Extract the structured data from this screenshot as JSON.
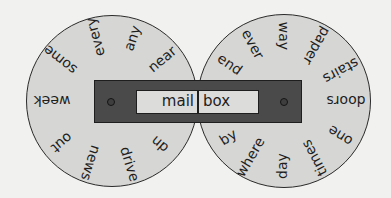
{
  "colors": {
    "background": "#f1f1ef",
    "wheel_fill": "#d6d6d4",
    "slider_fill": "#4a4a4a",
    "outline": "#1e1e1e"
  },
  "window": {
    "left_word": "mail",
    "right_word": "box"
  },
  "left_wheel": {
    "center": [
      112,
      101
    ],
    "radius": 86,
    "words": [
      {
        "text": "near",
        "x": 162,
        "y": 59,
        "rot": -40
      },
      {
        "text": "any",
        "x": 132,
        "y": 38,
        "rot": -72
      },
      {
        "text": "every",
        "x": 95,
        "y": 37,
        "rot": -105
      },
      {
        "text": "some",
        "x": 60,
        "y": 60,
        "rot": -142
      },
      {
        "text": "week",
        "x": 52,
        "y": 101,
        "rot": 180
      },
      {
        "text": "out",
        "x": 62,
        "y": 143,
        "rot": 140
      },
      {
        "text": "news",
        "x": 91,
        "y": 163,
        "rot": 108
      },
      {
        "text": "drive",
        "x": 130,
        "y": 164,
        "rot": 73
      },
      {
        "text": "up",
        "x": 161,
        "y": 143,
        "rot": 40
      }
    ]
  },
  "right_wheel": {
    "center": [
      284,
      101
    ],
    "radius": 87,
    "words": [
      {
        "text": "end",
        "x": 230,
        "y": 64,
        "rot": 35
      },
      {
        "text": "ever",
        "x": 253,
        "y": 44,
        "rot": 62
      },
      {
        "text": "way",
        "x": 284,
        "y": 36,
        "rot": 90
      },
      {
        "text": "paper",
        "x": 317,
        "y": 46,
        "rot": 120
      },
      {
        "text": "stairs",
        "x": 341,
        "y": 71,
        "rot": 152
      },
      {
        "text": "doors",
        "x": 346,
        "y": 101,
        "rot": 180
      },
      {
        "text": "one",
        "x": 340,
        "y": 136,
        "rot": 212
      },
      {
        "text": "times",
        "x": 314,
        "y": 158,
        "rot": 242
      },
      {
        "text": "day",
        "x": 282,
        "y": 166,
        "rot": 270
      },
      {
        "text": "where",
        "x": 250,
        "y": 157,
        "rot": 300
      },
      {
        "text": "by",
        "x": 228,
        "y": 137,
        "rot": 328
      }
    ]
  }
}
